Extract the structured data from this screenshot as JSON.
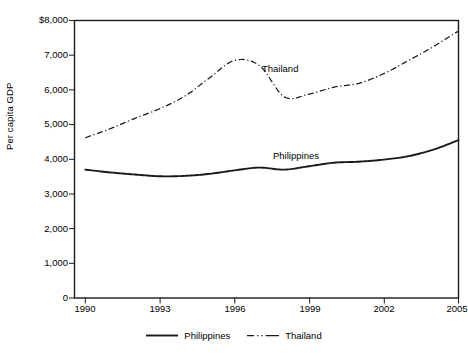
{
  "chart_data": {
    "type": "line",
    "title": "",
    "xlabel": "",
    "ylabel": "Per capita GDP",
    "xlim": [
      1990,
      2005
    ],
    "ylim": [
      0,
      8000
    ],
    "grid": false,
    "legend_position": "bottom-center",
    "x": [
      1990,
      1991,
      1992,
      1993,
      1994,
      1995,
      1996,
      1997,
      1998,
      1999,
      2000,
      2001,
      2002,
      2003,
      2004,
      2005
    ],
    "x_tick_labels": [
      "1990",
      "1993",
      "1996",
      "1999",
      "2002",
      "2005"
    ],
    "x_ticks": [
      1990,
      1993,
      1996,
      1999,
      2002,
      2005
    ],
    "y_tick_labels": [
      "$8,000",
      "7,000",
      "6,000",
      "5,000",
      "4,000",
      "3,000",
      "2,000",
      "1,000",
      "0"
    ],
    "y_ticks": [
      8000,
      7000,
      6000,
      5000,
      4000,
      3000,
      2000,
      1000,
      0
    ],
    "series": [
      {
        "name": "Philippines",
        "line_style": "solid",
        "color": "#1a1a1a",
        "annotation": "Philippines",
        "values": [
          3700,
          3620,
          3560,
          3510,
          3520,
          3580,
          3680,
          3760,
          3700,
          3800,
          3900,
          3930,
          3990,
          4090,
          4280,
          4550
        ]
      },
      {
        "name": "Thailand",
        "line_style": "dash-dot",
        "color": "#1a1a1a",
        "annotation": "Thailand",
        "values": [
          4620,
          4880,
          5180,
          5460,
          5820,
          6350,
          6850,
          6700,
          5800,
          5880,
          6080,
          6190,
          6470,
          6850,
          7250,
          7700
        ]
      }
    ]
  },
  "axes": {
    "y_title": "Per capita GDP",
    "y_tick_labels": [
      "$8,000",
      "7,000",
      "6,000",
      "5,000",
      "4,000",
      "3,000",
      "2,000",
      "1,000",
      "0"
    ],
    "x_tick_labels": [
      "1990",
      "1993",
      "1996",
      "1999",
      "2002",
      "2005"
    ]
  },
  "annotations": {
    "thailand": "Thailand",
    "philippines": "Philippines"
  },
  "legend": {
    "entries": [
      {
        "label": "Philippines",
        "style": "solid"
      },
      {
        "label": "Thailand",
        "style": "dash-dot"
      }
    ]
  },
  "style": {
    "line_color": "#1a1a1a",
    "axis_color": "#1a1a1a",
    "background": "#ffffff"
  }
}
